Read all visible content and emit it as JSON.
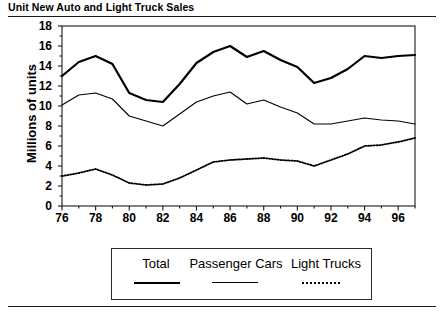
{
  "title": "Unit New Auto and Light Truck Sales",
  "axis": {
    "ylabel": "Millions of units",
    "yticks": [
      "0",
      "2",
      "4",
      "6",
      "8",
      "10",
      "12",
      "14",
      "16",
      "18"
    ],
    "xticks": [
      "76",
      "78",
      "80",
      "82",
      "84",
      "86",
      "88",
      "90",
      "92",
      "94",
      "96"
    ]
  },
  "legend": {
    "entries": [
      {
        "label": "Total",
        "style": "thick-solid"
      },
      {
        "label": "Passenger Cars",
        "style": "thin-solid"
      },
      {
        "label": "Light Trucks",
        "style": "dotted"
      }
    ]
  },
  "colors": {
    "ink": "#000000",
    "frame": "#1a1a1a",
    "background": "#ffffff"
  },
  "chart_data": {
    "type": "line",
    "title": "Unit New Auto and Light Truck Sales",
    "xlabel": "",
    "ylabel": "Millions of units",
    "xlim": [
      76,
      97
    ],
    "ylim": [
      0,
      18
    ],
    "grid": false,
    "legend_position": "bottom",
    "x": [
      76,
      77,
      78,
      79,
      80,
      81,
      82,
      83,
      84,
      85,
      86,
      87,
      88,
      89,
      90,
      91,
      92,
      93,
      94,
      95,
      96,
      97
    ],
    "series": [
      {
        "name": "Total",
        "style": "thick-solid",
        "values": [
          13.0,
          14.4,
          15.0,
          14.2,
          11.3,
          10.6,
          10.4,
          12.2,
          14.3,
          15.4,
          16.0,
          14.9,
          15.5,
          14.6,
          13.9,
          12.3,
          12.8,
          13.7,
          15.0,
          14.8,
          15.0,
          15.1
        ]
      },
      {
        "name": "Passenger Cars",
        "style": "thin-solid",
        "values": [
          10.1,
          11.1,
          11.3,
          10.7,
          9.0,
          8.5,
          8.0,
          9.2,
          10.4,
          11.0,
          11.4,
          10.2,
          10.6,
          9.9,
          9.3,
          8.2,
          8.2,
          8.5,
          8.8,
          8.6,
          8.5,
          8.2
        ]
      },
      {
        "name": "Light Trucks",
        "style": "dotted",
        "values": [
          3.0,
          3.3,
          3.7,
          3.1,
          2.3,
          2.1,
          2.2,
          2.8,
          3.6,
          4.4,
          4.6,
          4.7,
          4.8,
          4.6,
          4.5,
          4.0,
          4.6,
          5.2,
          6.0,
          6.1,
          6.4,
          6.8
        ]
      }
    ]
  }
}
